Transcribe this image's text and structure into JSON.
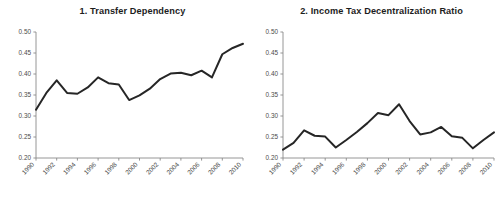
{
  "figure": {
    "background_color": "#ffffff",
    "line_color": "#262626",
    "axis_color": "#8a8a8a",
    "text_color": "#1d1d1d"
  },
  "panels": [
    {
      "title": "1. Transfer Dependency",
      "y_ticks": [
        "0.50",
        "0.45",
        "0.40",
        "0.35",
        "0.30",
        "0.25",
        "0.20"
      ],
      "x_ticks": [
        "1990",
        "1992",
        "1994",
        "1996",
        "1998",
        "2000",
        "2002",
        "2004",
        "2006",
        "2008",
        "2010"
      ]
    },
    {
      "title": "2. Income Tax Decentralization Ratio",
      "y_ticks": [
        "0.50",
        "0.45",
        "0.40",
        "0.35",
        "0.30",
        "0.25",
        "0.20"
      ],
      "x_ticks": [
        "1990",
        "1992",
        "1994",
        "1996",
        "1998",
        "2000",
        "2002",
        "2004",
        "2006",
        "2008",
        "2010"
      ]
    }
  ],
  "chart_data": [
    {
      "type": "line",
      "title": "1. Transfer Dependency",
      "xlabel": "",
      "ylabel": "",
      "xlim": [
        1990,
        2010
      ],
      "ylim": [
        0.2,
        0.5
      ],
      "grid": false,
      "legend": "none",
      "x": [
        1990,
        1991,
        1992,
        1993,
        1994,
        1995,
        1996,
        1997,
        1998,
        1999,
        2000,
        2001,
        2002,
        2003,
        2004,
        2005,
        2006,
        2007,
        2008,
        2009,
        2010
      ],
      "xtick_labels": [
        "1990",
        "1992",
        "1994",
        "1996",
        "1998",
        "2000",
        "2002",
        "2004",
        "2006",
        "2008",
        "2010"
      ],
      "ytick_labels": [
        "0.20",
        "0.25",
        "0.30",
        "0.35",
        "0.40",
        "0.45",
        "0.50"
      ],
      "series": [
        {
          "name": "Transfer Dependency",
          "color": "#262626",
          "values": [
            0.315,
            0.355,
            0.385,
            0.355,
            0.353,
            0.368,
            0.392,
            0.378,
            0.375,
            0.338,
            0.349,
            0.365,
            0.388,
            0.401,
            0.403,
            0.397,
            0.408,
            0.392,
            0.447,
            0.462,
            0.472
          ]
        }
      ]
    },
    {
      "type": "line",
      "title": "2. Income Tax Decentralization Ratio",
      "xlabel": "",
      "ylabel": "",
      "xlim": [
        1990,
        2010
      ],
      "ylim": [
        0.2,
        0.5
      ],
      "grid": false,
      "legend": "none",
      "x": [
        1990,
        1991,
        1992,
        1993,
        1994,
        1995,
        1996,
        1997,
        1998,
        1999,
        2000,
        2001,
        2002,
        2003,
        2004,
        2005,
        2006,
        2007,
        2008,
        2009,
        2010
      ],
      "xtick_labels": [
        "1990",
        "1992",
        "1994",
        "1996",
        "1998",
        "2000",
        "2002",
        "2004",
        "2006",
        "2008",
        "2010"
      ],
      "ytick_labels": [
        "0.20",
        "0.25",
        "0.30",
        "0.35",
        "0.40",
        "0.45",
        "0.50"
      ],
      "series": [
        {
          "name": "Income Tax Decentralization Ratio",
          "color": "#262626",
          "values": [
            0.22,
            0.236,
            0.266,
            0.253,
            0.251,
            0.225,
            0.243,
            0.262,
            0.283,
            0.307,
            0.302,
            0.328,
            0.288,
            0.256,
            0.261,
            0.274,
            0.252,
            0.248,
            0.223,
            0.243,
            0.261
          ]
        }
      ]
    }
  ]
}
